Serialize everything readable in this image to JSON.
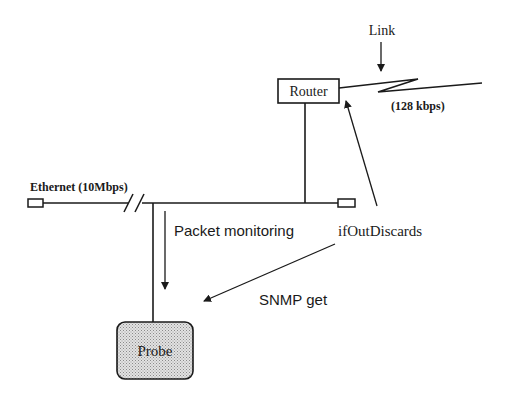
{
  "diagram": {
    "type": "network-monitoring",
    "nodes": {
      "router": {
        "label": "Router"
      },
      "probe": {
        "label": "Probe",
        "fill": "#c8c8c8"
      }
    },
    "labels": {
      "link": "Link",
      "link_speed": "(128 kbps)",
      "ethernet": "Ethernet (10Mbps)",
      "packet_monitoring": "Packet monitoring",
      "if_out_discards": "ifOutDiscards",
      "snmp_get": "SNMP get"
    },
    "edges": [
      {
        "from": "ethernet-segment",
        "to": "router",
        "kind": "connection"
      },
      {
        "from": "router",
        "to": "wan-link",
        "kind": "serial-link"
      },
      {
        "from": "ethernet-segment",
        "to": "probe",
        "kind": "connection"
      },
      {
        "from": "ethernet-segment",
        "to": "probe",
        "kind": "arrow",
        "label": "Packet monitoring"
      },
      {
        "from": "ifOutDiscards",
        "to": "router",
        "kind": "arrow"
      },
      {
        "from": "ifOutDiscards",
        "to": "probe",
        "kind": "arrow",
        "label": "SNMP get"
      },
      {
        "from": "Link",
        "to": "wan-link",
        "kind": "arrow"
      }
    ],
    "colors": {
      "stroke": "#1a1a1a",
      "background": "#ffffff",
      "probe_fill": "#c8c8c8"
    }
  }
}
